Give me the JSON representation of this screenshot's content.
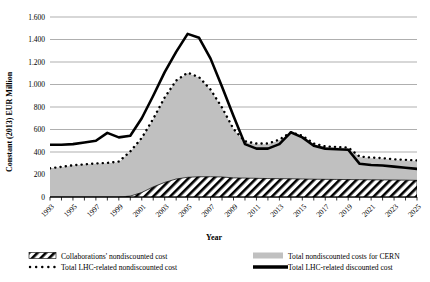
{
  "chart_data": {
    "type": "area",
    "title": "",
    "xlabel": "Year",
    "ylabel": "Constant (2013) EUR Million",
    "xlim": [
      1993,
      2025
    ],
    "ylim": [
      0,
      1600
    ],
    "ytick_step": 200,
    "grid": true,
    "legend_position": "bottom",
    "ytick_labels": [
      "0",
      "200",
      "400",
      "600",
      "800",
      "1.000",
      "1.200",
      "1.400",
      "1.600"
    ],
    "ytick_values": [
      0,
      200,
      400,
      600,
      800,
      1000,
      1200,
      1400,
      1600
    ],
    "xtick_labels": [
      "1993",
      "1995",
      "1997",
      "1999",
      "2001",
      "2003",
      "2005",
      "2007",
      "2009",
      "2011",
      "2013",
      "2015",
      "2017",
      "2019",
      "2021",
      "2023",
      "2025"
    ],
    "xtick_values": [
      1993,
      1995,
      1997,
      1999,
      2001,
      2003,
      2005,
      2007,
      2009,
      2011,
      2013,
      2015,
      2017,
      2019,
      2021,
      2023,
      2025
    ],
    "x": [
      1993,
      1994,
      1995,
      1996,
      1997,
      1998,
      1999,
      2000,
      2001,
      2002,
      2003,
      2004,
      2005,
      2006,
      2007,
      2008,
      2009,
      2010,
      2011,
      2012,
      2013,
      2014,
      2015,
      2016,
      2017,
      2018,
      2019,
      2020,
      2021,
      2022,
      2023,
      2024,
      2025
    ],
    "series": [
      {
        "name": "Collaborations' nondiscounted cost",
        "type": "area",
        "fill": "hatch-diagonal",
        "color": "#000000",
        "values": [
          0,
          0,
          0,
          0,
          0,
          0,
          0,
          8,
          40,
          90,
          130,
          160,
          175,
          180,
          180,
          178,
          170,
          168,
          166,
          164,
          163,
          162,
          160,
          158,
          157,
          156,
          155,
          154,
          153,
          152,
          151,
          150,
          148
        ]
      },
      {
        "name": "Total nondiscounted costs for CERN",
        "type": "area",
        "fill": "solid-gray",
        "color": "#c0c0c0",
        "values": [
          255,
          265,
          280,
          288,
          295,
          300,
          310,
          400,
          520,
          690,
          880,
          1030,
          1100,
          1060,
          950,
          790,
          600,
          490,
          470,
          470,
          505,
          570,
          540,
          470,
          445,
          440,
          435,
          355,
          345,
          340,
          330,
          325,
          320
        ]
      },
      {
        "name": "Total LHC-related nondiscounted cost",
        "type": "line",
        "style": "dotted",
        "color": "#000000",
        "values": [
          255,
          268,
          282,
          290,
          298,
          303,
          315,
          405,
          525,
          695,
          885,
          1035,
          1105,
          1065,
          955,
          795,
          605,
          495,
          475,
          475,
          510,
          575,
          545,
          475,
          450,
          445,
          440,
          360,
          350,
          345,
          335,
          330,
          325
        ]
      },
      {
        "name": "Total LHC-related discounted cost",
        "type": "line",
        "style": "solid",
        "color": "#000000",
        "values": [
          465,
          465,
          470,
          485,
          500,
          570,
          530,
          545,
          700,
          900,
          1110,
          1290,
          1450,
          1415,
          1230,
          980,
          720,
          470,
          430,
          430,
          470,
          575,
          530,
          455,
          430,
          425,
          420,
          295,
          285,
          280,
          270,
          260,
          250
        ]
      }
    ]
  },
  "axes": {
    "y_title": "Constant (2013) EUR Million",
    "x_title": "Year"
  },
  "legend": {
    "items": [
      {
        "key": "hatch",
        "label": "Collaborations' nondiscounted cost"
      },
      {
        "key": "dotted",
        "label": "Total LHC-related  nondiscounted cost"
      },
      {
        "key": "gray",
        "label": "Total nondiscounted costs for CERN"
      },
      {
        "key": "solid",
        "label": "Total LHC-related discounted cost"
      }
    ]
  },
  "colors": {
    "area_gray": "#c0c0c0",
    "grid": "#a6a6a6",
    "line": "#000000",
    "background": "#ffffff"
  }
}
